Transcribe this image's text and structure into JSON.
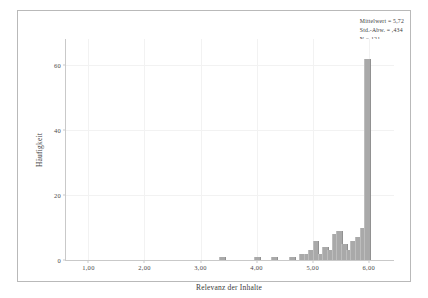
{
  "chart_data": {
    "type": "bar",
    "title": "",
    "xlabel": "Relevanz der Inhalte",
    "ylabel": "Häufigkeit",
    "xlim": [
      0.6,
      6.45
    ],
    "ylim": [
      0,
      68
    ],
    "grid": true,
    "bar_color": "#a9a9a9",
    "xticks": [
      "1,00",
      "2,00",
      "3,00",
      "4,00",
      "5,00",
      "6,00"
    ],
    "xtick_values": [
      1.0,
      2.0,
      3.0,
      4.0,
      5.0,
      6.0
    ],
    "yticks": [
      "0",
      "20",
      "40",
      "60"
    ],
    "ytick_values": [
      0,
      20,
      40,
      60
    ],
    "bin_width": 0.085,
    "x": [
      3.38,
      4.0,
      4.3,
      4.62,
      4.79,
      4.88,
      4.96,
      5.04,
      5.13,
      5.21,
      5.3,
      5.38,
      5.46,
      5.55,
      5.63,
      5.71,
      5.8,
      5.88,
      5.96
    ],
    "values": [
      1,
      1,
      1,
      1,
      2,
      2,
      3,
      6,
      2,
      4,
      3,
      8,
      9,
      5,
      3,
      6,
      7,
      10,
      62
    ],
    "categories": [
      "3,38",
      "4,00",
      "4,30",
      "4,62",
      "4,79",
      "4,88",
      "4,96",
      "5,04",
      "5,13",
      "5,21",
      "5,30",
      "5,38",
      "5,46",
      "5,55",
      "5,63",
      "5,71",
      "5,80",
      "5,88",
      "5,96"
    ]
  },
  "stats": {
    "mean_line": "Mittelwert = 5,72",
    "std_line": "Std.-Abw. = ,434",
    "n_line": "N = 121"
  }
}
